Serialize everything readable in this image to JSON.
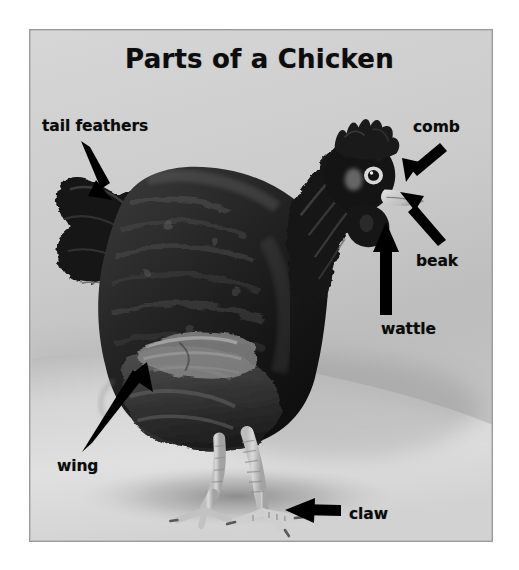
{
  "page": {
    "background_color": "#ffffff",
    "width": 519,
    "height": 570
  },
  "title": "Parts of a Chicken",
  "photo": {
    "subject": "chicken",
    "style": "black-and-white photograph",
    "border_color": "#9a9a9a",
    "background_color": "#c9c9c9",
    "ground_color": "#d8d8d8",
    "bird_color": "#1c1c1c"
  },
  "labels": {
    "tail_feathers": "tail feathers",
    "comb": "comb",
    "beak": "beak",
    "wattle": "wattle",
    "wing": "wing",
    "claw": "claw"
  },
  "annotations": {
    "arrow_color": "#000000",
    "items": [
      {
        "label": "tail feathers",
        "direction": "down-right",
        "target": "tail"
      },
      {
        "label": "comb",
        "direction": "down-left",
        "target": "comb"
      },
      {
        "label": "beak",
        "direction": "up-left",
        "target": "beak"
      },
      {
        "label": "wattle",
        "direction": "up",
        "target": "wattle"
      },
      {
        "label": "wing",
        "direction": "up-right",
        "target": "wing"
      },
      {
        "label": "claw",
        "direction": "left",
        "target": "claw"
      }
    ]
  }
}
